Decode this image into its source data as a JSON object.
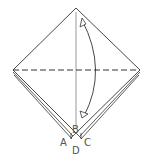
{
  "diagram": {
    "type": "origami-fold-step",
    "colors": {
      "line": "#333333",
      "label": "#555555",
      "paper": "#ffffff"
    },
    "fold_line": "valley-fold-horizontal-dashed",
    "arrow": "fold-down-and-back-curved-arrow",
    "labels": {
      "a": "A",
      "b": "B",
      "c": "C",
      "d": "D"
    }
  }
}
